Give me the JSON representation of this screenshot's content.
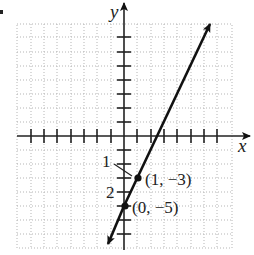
{
  "figure": {
    "axis_labels": {
      "x": "x",
      "y": "y"
    },
    "points": [
      {
        "label": "(1, −3)",
        "x": 1,
        "y": -3
      },
      {
        "label": "(0, −5)",
        "x": 0,
        "y": -5
      }
    ],
    "callouts": [
      {
        "label": "1"
      },
      {
        "label": "2"
      }
    ],
    "line": {
      "slope": 2,
      "intercept": -5,
      "equation": "y = 2x - 5"
    },
    "grid": {
      "x_range": [
        -8,
        8
      ],
      "y_range": [
        -8,
        8
      ],
      "style": "dotted"
    },
    "colors": {
      "line": "#111111",
      "grid": "#b0b0b0",
      "axis": "#222222"
    }
  }
}
